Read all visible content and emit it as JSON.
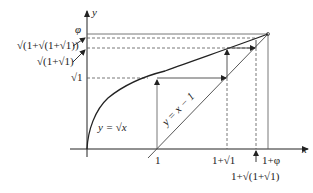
{
  "axes": {
    "x_label": "x",
    "y_label": "y"
  },
  "curves": {
    "sqrt_label": "y = √x",
    "line_label": "y = x − 1"
  },
  "y_ticks": {
    "phi": "φ",
    "nested2": "√(1+√(1+√1))",
    "nested1": "√(1+√1)",
    "root1": "√1"
  },
  "x_ticks": {
    "one": "1",
    "one_plus_root1": "1+√1",
    "one_plus_phi": "1+φ",
    "one_plus_nested": "1+√(1+√1)"
  },
  "colors": {
    "stroke": "#222222",
    "light": "#666666"
  }
}
